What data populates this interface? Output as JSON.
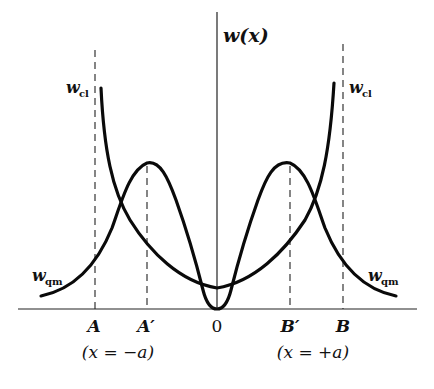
{
  "figure": {
    "y_axis_label": "w(x)",
    "curves": [
      {
        "name": "classical probability density",
        "label_main": "w",
        "label_sub": "cl"
      },
      {
        "name": "quantum probability density",
        "label_main": "w",
        "label_sub": "qm"
      }
    ],
    "x_ticks": [
      {
        "label": "A",
        "note": "classical turning point (left)"
      },
      {
        "label": "A′",
        "note": "quantum peak (left)"
      },
      {
        "label": "0",
        "note": "origin"
      },
      {
        "label": "B′",
        "note": "quantum peak (right)"
      },
      {
        "label": "B",
        "note": "classical turning point (right)"
      }
    ],
    "left_annotation": "(x = −a)",
    "right_annotation": "(x = +a)",
    "colors": {
      "curve": "#0a0a0a",
      "axis": "#222222",
      "background": "#ffffff"
    }
  }
}
